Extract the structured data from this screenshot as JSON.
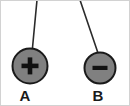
{
  "diagram": {
    "type": "electrostatics-hanging-charges",
    "background_color": "#ffffff",
    "border_color": "#c8c8c8",
    "sphere_fill": "#808080",
    "sphere_stroke": "#1a1a1a",
    "string_color": "#2b2b2b",
    "symbol_color": "#111111",
    "label_color": "#1a1a1a",
    "pivot": {
      "x_left": 37,
      "x_right": 80,
      "y": 0
    },
    "objects": [
      {
        "id": "A",
        "label": "A",
        "charge_sign": "+",
        "charge_symbol_name": "plus-sign",
        "center_x": 30,
        "center_y": 66,
        "radius": 18,
        "string_anchor_x": 37,
        "string_anchor_y": 0,
        "label_x": 25,
        "label_y": 101
      },
      {
        "id": "B",
        "label": "B",
        "charge_sign": "−",
        "charge_symbol_name": "minus-sign",
        "center_x": 100,
        "center_y": 68,
        "radius": 16,
        "string_anchor_x": 80,
        "string_anchor_y": 0,
        "label_x": 98,
        "label_y": 101
      }
    ]
  }
}
